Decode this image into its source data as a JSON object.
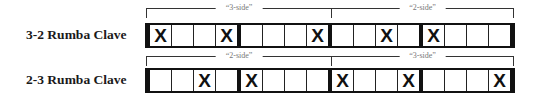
{
  "rows": [
    {
      "label": "3-2 Rumba Clave",
      "sides": [
        {
          "label": "“3-side”"
        },
        {
          "label": "“2-side”"
        }
      ],
      "cells": [
        "X",
        "",
        "",
        "X",
        "",
        "",
        "",
        "X",
        "",
        "",
        "X",
        "",
        "X",
        "",
        "",
        ""
      ]
    },
    {
      "label": "2-3 Rumba Clave",
      "sides": [
        {
          "label": "“2-side”"
        },
        {
          "label": "“3-side”"
        }
      ],
      "cells": [
        "",
        "",
        "X",
        "",
        "X",
        "",
        "",
        "",
        "X",
        "",
        "",
        "X",
        "",
        "",
        "",
        "X"
      ]
    }
  ],
  "mark_glyph": "X",
  "cells_per_beat": 4,
  "total_cells": 16
}
